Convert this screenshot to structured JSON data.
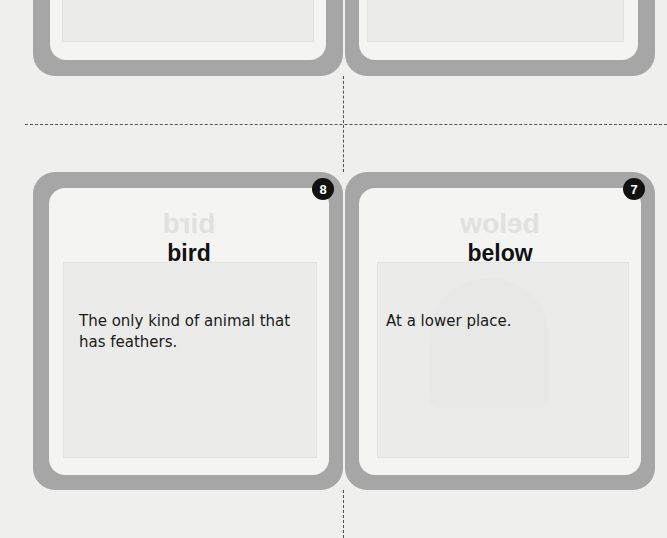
{
  "page": {
    "background": "#efefed",
    "card_frame_color": "#a6a6a6",
    "badge_color": "#111111"
  },
  "top_row": {
    "cards": [
      {
        "position": "left",
        "partially_visible": true
      },
      {
        "position": "right",
        "partially_visible": true
      }
    ]
  },
  "cut_lines": {
    "horizontal": "dashed",
    "vertical": "dashed"
  },
  "cards": [
    {
      "number": "8",
      "word": "bird",
      "mirrored_ghost_word": "bird",
      "definition": "The only kind of animal that has feathers."
    },
    {
      "number": "7",
      "word": "below",
      "mirrored_ghost_word": "below",
      "definition": "At a lower place."
    }
  ]
}
